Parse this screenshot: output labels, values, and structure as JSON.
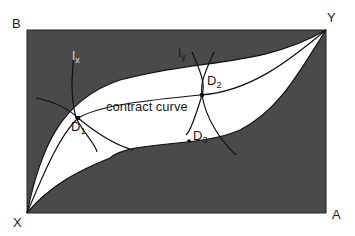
{
  "diagram": {
    "corners": {
      "top_left": "B",
      "top_right": "Y",
      "bottom_left": "X",
      "bottom_right": "A"
    },
    "indifference_curves": {
      "ix": {
        "base": "I",
        "sub": "x"
      },
      "iy": {
        "base": "I",
        "sub": "y"
      }
    },
    "points": {
      "d1": {
        "base": "D",
        "sub": "1"
      },
      "d2": {
        "base": "D",
        "sub": "2"
      },
      "d3": {
        "base": "D",
        "sub": "3"
      }
    },
    "contract_curve_label": "contract curve",
    "colors": {
      "shaded_region": "#4a4a4a",
      "lens_region": "#ffffff",
      "line": "#111111"
    }
  }
}
